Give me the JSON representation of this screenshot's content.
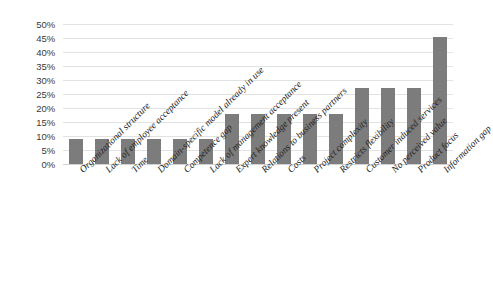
{
  "chart_data": {
    "type": "bar",
    "title": "",
    "subtitle": "",
    "xlabel": "",
    "ylabel": "",
    "ylim": [
      0,
      50
    ],
    "ytick_step": 5,
    "ytick_labels": [
      "0%",
      "5%",
      "10%",
      "15%",
      "20%",
      "25%",
      "30%",
      "35%",
      "40%",
      "45%",
      "50%"
    ],
    "ytick_values": [
      0,
      5,
      10,
      15,
      20,
      25,
      30,
      35,
      40,
      45,
      50
    ],
    "grid": "horizontal",
    "legend": "none",
    "value_suffix": "%",
    "bar_color": "#7c7c7c",
    "gridline_color": "#e2e2e2",
    "categories": [
      "Organizational structure",
      "Lack of employee acceptance",
      "Time",
      "Domain-specific model already in use",
      "Competence gap",
      "Lack of management acceptance",
      "Expert knowledge present",
      "Relations to business partners",
      "Costs",
      "Project complexity",
      "Restricts flexibility",
      "Customer induced services",
      "No perceived value",
      "Product focus",
      "Information gap"
    ],
    "values": [
      9,
      9,
      9,
      9,
      9,
      9,
      18,
      18,
      18,
      18,
      18,
      27,
      27,
      27,
      45.5
    ]
  }
}
